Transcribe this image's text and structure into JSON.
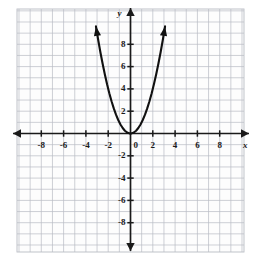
{
  "figure": {
    "kind": "coordinate-plane-graph",
    "background_color": "#fdfdfd",
    "grid_color": "#b9bcc4",
    "axis_color": "#1a1a1a",
    "curve_color": "#111111"
  },
  "axes": {
    "x_axis_label": "x",
    "y_axis_label": "y",
    "origin_label": "0",
    "x_tick_labels": [
      "-8",
      "-6",
      "-4",
      "-2",
      "2",
      "4",
      "6",
      "8"
    ],
    "y_tick_labels": [
      "8",
      "6",
      "4",
      "2",
      "-2",
      "-4",
      "-6",
      "-8"
    ],
    "x_arrow_left": "arrow-left",
    "x_arrow_right": "arrow-right",
    "y_arrow_up": "arrow-up",
    "y_arrow_down": "arrow-down"
  },
  "chart_data": {
    "type": "line",
    "title": "",
    "xlabel": "x",
    "ylabel": "y",
    "xlim": [
      -9.5,
      9.5
    ],
    "ylim": [
      -10.5,
      10.5
    ],
    "grid": true,
    "grid_step": 1,
    "tick_step": 2,
    "legend": "none",
    "series": [
      {
        "name": "y = x^2",
        "equation": "y = x^2",
        "vertex": [
          0,
          0
        ],
        "arrowheads": [
          "start",
          "end"
        ],
        "x": [
          -3.1,
          -2.9,
          -2.7,
          -2.5,
          -2.3,
          -2.1,
          -1.9,
          -1.7,
          -1.5,
          -1.3,
          -1.1,
          -0.9,
          -0.7,
          -0.5,
          -0.3,
          -0.1,
          0,
          0.1,
          0.3,
          0.5,
          0.7,
          0.9,
          1.1,
          1.3,
          1.5,
          1.7,
          1.9,
          2.1,
          2.3,
          2.5,
          2.7,
          2.9,
          3.1
        ],
        "y": [
          9.61,
          8.41,
          7.29,
          6.25,
          5.29,
          4.41,
          3.61,
          2.89,
          2.25,
          1.69,
          1.21,
          0.81,
          0.49,
          0.25,
          0.09,
          0.01,
          0,
          0.01,
          0.09,
          0.25,
          0.49,
          0.81,
          1.21,
          1.69,
          2.25,
          2.89,
          3.61,
          4.41,
          5.29,
          6.25,
          7.29,
          8.41,
          9.61
        ]
      }
    ]
  }
}
